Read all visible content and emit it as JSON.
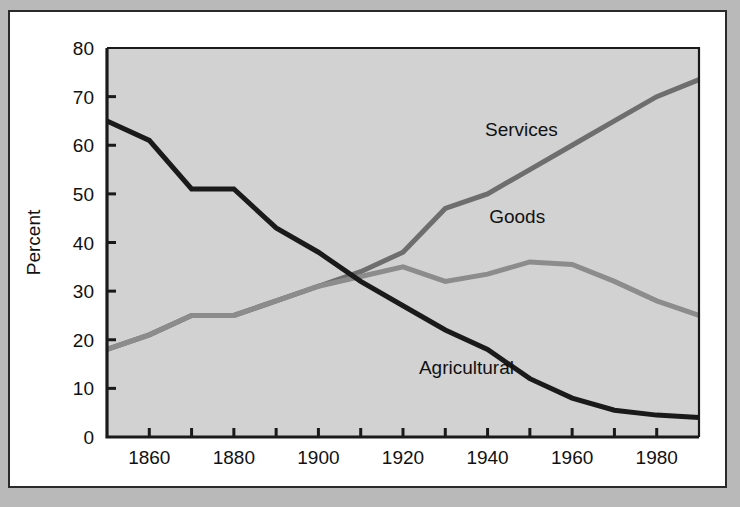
{
  "figure": {
    "background_color": "#b9b9b9",
    "card_background": "#ffffff",
    "plot_background": "#d2d2d2",
    "frame_color": "#2a2a2a"
  },
  "chart_data": {
    "type": "line",
    "title": "",
    "subtitle": "",
    "xlabel": "",
    "ylabel": "Percent",
    "xlim": [
      1850,
      1990
    ],
    "ylim": [
      0,
      80
    ],
    "grid": false,
    "legend_position": "inline-annotations",
    "x_tick_values": [
      1850,
      1860,
      1870,
      1880,
      1890,
      1900,
      1910,
      1920,
      1930,
      1940,
      1950,
      1960,
      1970,
      1980,
      1990
    ],
    "x_tick_labels": [
      "1860",
      "1880",
      "1900",
      "1920",
      "1940",
      "1960",
      "1980"
    ],
    "x_labeled_values": [
      1860,
      1880,
      1900,
      1920,
      1940,
      1960,
      1980
    ],
    "y_tick_values": [
      0,
      10,
      20,
      30,
      40,
      50,
      60,
      70,
      80
    ],
    "y_tick_labels": [
      "0",
      "10",
      "20",
      "30",
      "40",
      "50",
      "60",
      "70",
      "80"
    ],
    "x": [
      1850,
      1860,
      1870,
      1880,
      1890,
      1900,
      1910,
      1920,
      1930,
      1940,
      1950,
      1960,
      1970,
      1980,
      1990
    ],
    "series": [
      {
        "name": "Agricultural",
        "color": "#1a1a1a",
        "line_width": 5,
        "label_x": 1935,
        "label_y": 13,
        "values": [
          65,
          61,
          51,
          51,
          43,
          38,
          32,
          27,
          22,
          18,
          12,
          8,
          5.5,
          4.5,
          4
        ]
      },
      {
        "name": "Services",
        "color": "#6e6e6e",
        "line_width": 5,
        "label_x": 1948,
        "label_y": 62,
        "values": [
          18,
          21,
          25,
          25,
          28,
          31,
          34,
          38,
          47,
          50,
          55,
          60,
          65,
          70,
          73.5
        ]
      },
      {
        "name": "Goods",
        "color": "#8c8c8c",
        "line_width": 5,
        "label_x": 1947,
        "label_y": 44,
        "values": [
          18,
          21,
          25,
          25,
          28,
          31,
          33,
          35,
          32,
          33.5,
          36,
          35.5,
          32,
          28,
          25
        ]
      }
    ]
  }
}
